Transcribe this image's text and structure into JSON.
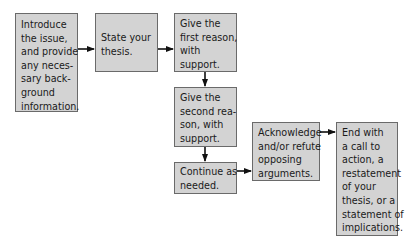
{
  "diagram": {
    "type": "flowchart",
    "colors": {
      "box_fill": "#d3d3d3",
      "box_border": "#6a6a6a",
      "arrow": "#111111"
    },
    "nodes": [
      {
        "id": "intro",
        "lines": [
          "Introduce",
          "the issue,",
          "and provide",
          "any neces-",
          "sary back-",
          "ground",
          "information."
        ]
      },
      {
        "id": "thesis",
        "lines": [
          "State your",
          "thesis."
        ]
      },
      {
        "id": "reason1",
        "lines": [
          "Give the",
          "first reason,",
          "with",
          "support."
        ]
      },
      {
        "id": "reason2",
        "lines": [
          "Give the",
          "second rea-",
          "son, with",
          "support."
        ]
      },
      {
        "id": "continue",
        "lines": [
          "Continue as",
          "needed."
        ]
      },
      {
        "id": "opposing",
        "lines": [
          "Acknowledge",
          "and/or refute",
          "opposing",
          "arguments."
        ]
      },
      {
        "id": "end",
        "lines": [
          "End with",
          "a call to",
          "action, a",
          "restatement",
          "of your",
          "thesis, or a",
          "statement of",
          "implications."
        ]
      }
    ],
    "edges": [
      {
        "from": "intro",
        "to": "thesis"
      },
      {
        "from": "thesis",
        "to": "reason1"
      },
      {
        "from": "reason1",
        "to": "reason2"
      },
      {
        "from": "reason2",
        "to": "continue"
      },
      {
        "from": "continue",
        "to": "opposing"
      },
      {
        "from": "opposing",
        "to": "end"
      }
    ]
  }
}
